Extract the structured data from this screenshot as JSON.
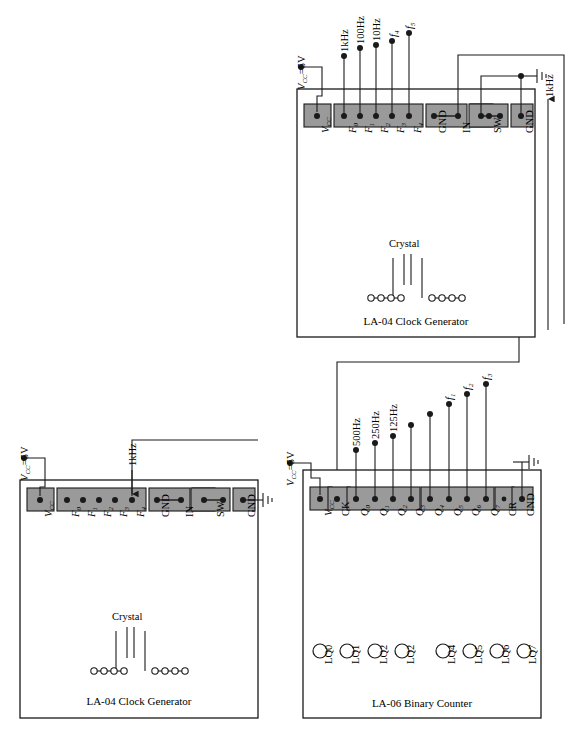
{
  "diagram": {
    "supply_label": "V<sub>CC</sub>=5V",
    "ground_icon": "ground-icon",
    "crystal_label": "Crystal"
  },
  "modules": [
    {
      "id": "clock-top",
      "name": "LA-04 Clock Generator (top)",
      "caption": "LA‐04 Clock Generator",
      "crystal_label": "Crystal",
      "supply_label": "Vᴄᴄ=5V",
      "pins": [
        {
          "label": "V",
          "sub": "CC",
          "italic": true
        },
        {
          "label": "F",
          "sub": "0",
          "italic": true
        },
        {
          "label": "F",
          "sub": "1",
          "italic": true
        },
        {
          "label": "F",
          "sub": "2",
          "italic": true
        },
        {
          "label": "F",
          "sub": "3",
          "italic": true
        },
        {
          "label": "F",
          "sub": "4",
          "italic": true
        },
        {
          "label": "GND",
          "sub": "",
          "italic": false
        },
        {
          "label": "IN",
          "sub": "",
          "italic": false
        },
        {
          "label": "SW",
          "sub": "",
          "italic": false
        },
        {
          "label": "GND",
          "sub": "",
          "italic": false
        }
      ],
      "signal_labels": [
        {
          "text": "1kHz",
          "pin": "F0"
        },
        {
          "text": "100Hz",
          "pin": "F1"
        },
        {
          "text": "10Hz",
          "pin": "F2"
        },
        {
          "text": "f",
          "sub": "4",
          "pin": "F3"
        },
        {
          "text": "f",
          "sub": "5",
          "pin": "F4"
        }
      ],
      "output_wire_label": "1kHz"
    },
    {
      "id": "clock-bottom",
      "name": "LA-04 Clock Generator (bottom left)",
      "caption": "LA‐04 Clock Generator",
      "crystal_label": "Crystal",
      "supply_label": "Vᴄᴄ=5V",
      "pins": [
        {
          "label": "V",
          "sub": "CC",
          "italic": true
        },
        {
          "label": "F",
          "sub": "0",
          "italic": true
        },
        {
          "label": "F",
          "sub": "1",
          "italic": true
        },
        {
          "label": "F",
          "sub": "2",
          "italic": true
        },
        {
          "label": "F",
          "sub": "3",
          "italic": true
        },
        {
          "label": "F",
          "sub": "4",
          "italic": true
        },
        {
          "label": "GND",
          "sub": "",
          "italic": false
        },
        {
          "label": "IN",
          "sub": "",
          "italic": false
        },
        {
          "label": "SW",
          "sub": "",
          "italic": false
        },
        {
          "label": "GND",
          "sub": "",
          "italic": false
        }
      ],
      "input_wire_label": "1kHz"
    },
    {
      "id": "counter",
      "name": "LA-06 Binary Counter",
      "caption": "LA‐06 Binary Counter",
      "supply_label": "Vᴄᴄ=5V",
      "pins": [
        {
          "label": "V",
          "sub": "CC",
          "italic": true
        },
        {
          "label": "CK",
          "sub": "",
          "italic": false
        },
        {
          "label": "Q",
          "sub": "0",
          "italic": true
        },
        {
          "label": "Q",
          "sub": "1",
          "italic": true
        },
        {
          "label": "Q",
          "sub": "2",
          "italic": true
        },
        {
          "label": "Q",
          "sub": "3",
          "italic": true
        },
        {
          "label": "Q",
          "sub": "4",
          "italic": true
        },
        {
          "label": "Q",
          "sub": "5",
          "italic": true
        },
        {
          "label": "Q",
          "sub": "6",
          "italic": true
        },
        {
          "label": "Q",
          "sub": "7",
          "italic": true
        },
        {
          "label": "CR",
          "sub": "",
          "italic": false
        },
        {
          "label": "GND",
          "sub": "",
          "italic": false
        }
      ],
      "signal_labels": [
        {
          "text": "500Hz",
          "pin": "Q0"
        },
        {
          "text": "250Hz",
          "pin": "Q1"
        },
        {
          "text": "125Hz",
          "pin": "Q2"
        },
        {
          "text": "f",
          "sub": "1",
          "pin": "Q5"
        },
        {
          "text": "f",
          "sub": "2",
          "pin": "Q6"
        },
        {
          "text": "f",
          "sub": "3",
          "pin": "Q7"
        }
      ],
      "leds": [
        "LQ0",
        "LQ1",
        "LQ2",
        "LQ2",
        "LQ4",
        "LQ5",
        "LQ6",
        "LQ7"
      ]
    }
  ],
  "colors": {
    "line": "#1a1a1a",
    "pin_strip_fill": "#9a9a9a",
    "background": "#ffffff"
  }
}
